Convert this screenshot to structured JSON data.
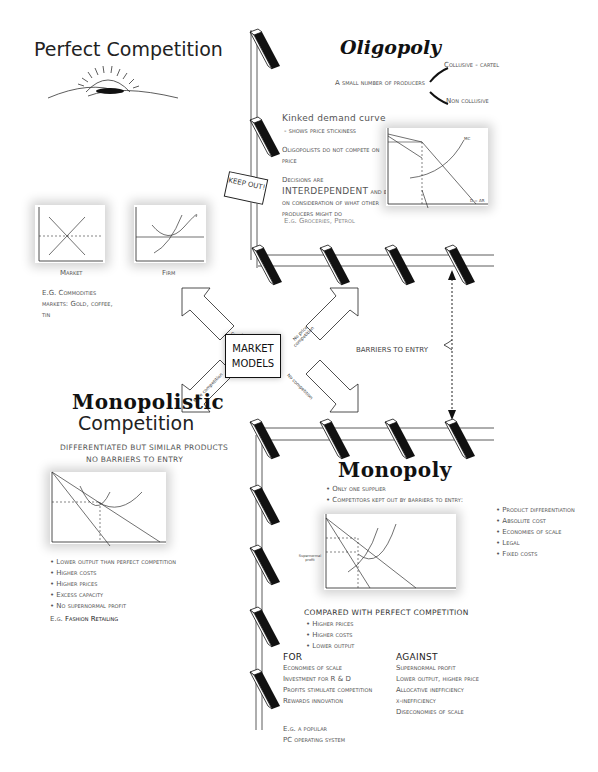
{
  "perfect_competition": {
    "title": "Perfect Competition",
    "market_chart": {
      "caption": "Market",
      "y_label": "£",
      "p_label": "P",
      "s_label": "S",
      "d_label": "D",
      "x_label": "Industry output",
      "origin": "0"
    },
    "firm_chart": {
      "caption": "Firm",
      "y_label": "£",
      "p_label": "P",
      "mc_label": "MC",
      "ac_label": "AC",
      "line_label": "AR = MR",
      "x_label": "Firm output"
    },
    "example": "E.G. Commodities markets: Gold, coffee, tin"
  },
  "oligopoly": {
    "title": "Oligopoly",
    "definition": "A small number of producers",
    "branch_collusive": "Collusive - cartel",
    "branch_non_collusive": "Non collusive",
    "kinked_heading": "Kinked demand curve",
    "kinked_sub": "- shows price stickiness",
    "point_compete": "Oligopolists do not compete on price",
    "point_decisions_a": "Decisions are",
    "point_decisions_big": "INTERDEPENDENT",
    "point_decisions_b": "and based on consideration of what other producers might do",
    "example": "E.g. Groceries, Petrol",
    "chart": {
      "y_label": "£",
      "p_label": "P",
      "mc_label": "MC",
      "mr_label": "MR",
      "q_label": "Q",
      "d_label": "D = AR"
    }
  },
  "keep_out_sign": "KEEP OUT!",
  "center": {
    "label_line1": "MARKET",
    "label_line2": "MODELS",
    "arrows": {
      "top_left": "Price competition",
      "top_right": "No price competition",
      "bottom_left": "Price competition",
      "bottom_right": "No competition"
    }
  },
  "barriers_label": "BARRIERS TO ENTRY",
  "monopolistic": {
    "title_line1": "Monopolistic",
    "title_line2": "Competition",
    "sub1": "DIFFERENTIATED BUT SIMILAR PRODUCTS",
    "sub2": "NO BARRIERS TO ENTRY",
    "chart": {
      "p_label": "P",
      "mc_label": "MC",
      "ac_label": "AC",
      "ar_label": "AR",
      "mr_label": "MR",
      "q_label": "Q"
    },
    "bullets": [
      "Lower output than perfect competition",
      "Higher costs",
      "Higher prices",
      "Excess capacity",
      "No supernormal profit"
    ],
    "example_prefix": "E.g.",
    "example": "Fashion Retailing"
  },
  "monopoly": {
    "title": "Monopoly",
    "bullets": [
      "Only one supplier",
      "Competitors kept out by barriers to entry:"
    ],
    "barriers": [
      "Product differentiation",
      "Absolute cost",
      "Economies of scale",
      "Legal",
      "Fixed costs"
    ],
    "chart": {
      "profit_label": "Supernormal profit",
      "mc_label": "MC",
      "ac_label": "AC",
      "mr_label": "MR",
      "ar_label": "AR",
      "q_label": "Qm",
      "origin": "0"
    },
    "compared_heading": "COMPARED WITH PERFECT COMPETITION",
    "compared": [
      "Higher prices",
      "Higher costs",
      "Lower output"
    ],
    "for_heading": "FOR",
    "for_items": [
      "Economies of scale",
      "Investment for R & D",
      "Profits stimulate competition",
      "Rewards innovation"
    ],
    "against_heading": "AGAINST",
    "against_items": [
      "Supernormal profit",
      "Lower output, higher price",
      "Allocative inefficiency",
      "x-inefficiency",
      "Diseconomies of scale"
    ],
    "example_line1": "E.g. a popular",
    "example_line2": "PC operating system"
  }
}
